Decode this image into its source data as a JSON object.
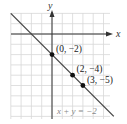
{
  "chart_data": {
    "type": "line",
    "title": "",
    "xlabel": "x",
    "ylabel": "y",
    "xlim": [
      -4,
      5.6
    ],
    "ylim": [
      -8.3,
      2
    ],
    "grid": true,
    "series": [
      {
        "name": "x + y = -2",
        "x": [
          -4,
          6
        ],
        "values": [
          2,
          -8
        ]
      }
    ],
    "points": [
      {
        "x": 0,
        "y": -2,
        "label": "(0, −2)"
      },
      {
        "x": 2,
        "y": -4,
        "label": "(2, −4)"
      },
      {
        "x": 3,
        "y": -5,
        "label": "(3, −5)"
      }
    ],
    "annotations": [
      {
        "text": "x + y = −2"
      }
    ],
    "colors": {
      "line": "#444444",
      "grid": "#d8d8d8",
      "axis": "#333333",
      "point": "#111111",
      "equation": "#888888"
    }
  }
}
